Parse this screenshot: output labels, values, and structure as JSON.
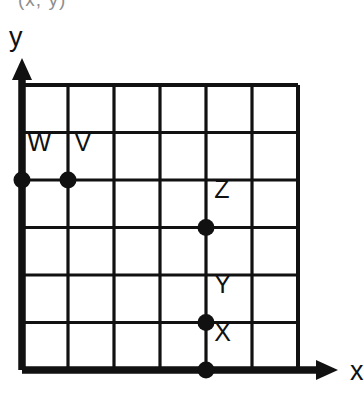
{
  "figure": {
    "clipped_top_caption": "(x, y)",
    "background_color": "#ffffff",
    "ink_color": "#111111"
  },
  "axes": {
    "x_label": "x",
    "y_label": "y",
    "x_arrow_icon": "arrow-right-icon",
    "y_arrow_icon": "arrow-up-icon"
  },
  "chart_data": {
    "type": "scatter",
    "title": "",
    "xlabel": "x",
    "ylabel": "y",
    "xlim": [
      0,
      6
    ],
    "ylim": [
      0,
      6
    ],
    "grid": true,
    "grid_columns": 6,
    "grid_rows": 6,
    "tick_labels_shown": false,
    "legend": false,
    "points": [
      {
        "label": "W",
        "x": 0,
        "y": 4,
        "label_dx": 0.12,
        "label_dy": 0.62
      },
      {
        "label": "V",
        "x": 1,
        "y": 4,
        "label_dx": 0.14,
        "label_dy": 0.62
      },
      {
        "label": "Z",
        "x": 4,
        "y": 3,
        "label_dx": 0.18,
        "label_dy": 0.62
      },
      {
        "label": "Y",
        "x": 4,
        "y": 1,
        "label_dx": 0.18,
        "label_dy": 0.62
      },
      {
        "label": "X",
        "x": 4,
        "y": 0,
        "label_dx": 0.18,
        "label_dy": 0.62
      }
    ]
  }
}
